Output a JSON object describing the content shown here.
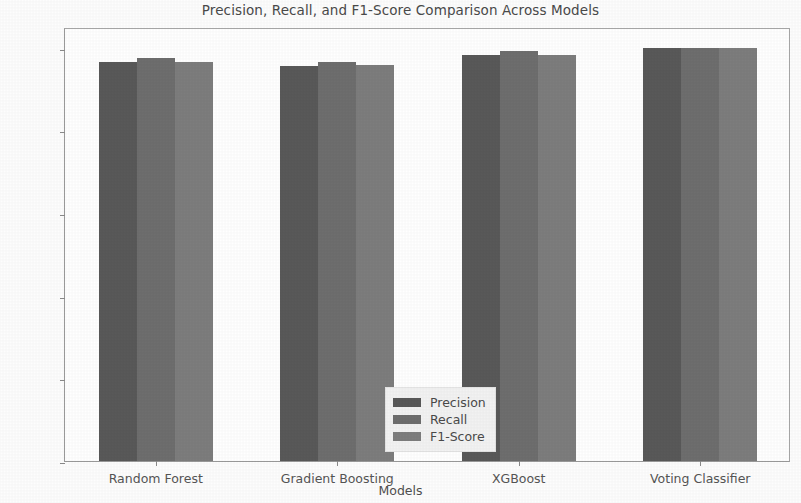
{
  "chart_data": {
    "type": "bar",
    "title": "Precision, Recall, and F1-Score Comparison Across Models",
    "xlabel": "Models",
    "ylabel": "Scores",
    "categories": [
      "Random Forest",
      "Gradient Boosting",
      "XGBoost",
      "Voting Classifier"
    ],
    "series": [
      {
        "name": "Precision",
        "values": [
          0.965,
          0.955,
          0.982,
          1.0
        ],
        "color": "#595959"
      },
      {
        "name": "Recall",
        "values": [
          0.975,
          0.965,
          0.993,
          1.0
        ],
        "color": "#6e6e6e"
      },
      {
        "name": "F1-Score",
        "values": [
          0.965,
          0.957,
          0.982,
          1.0
        ],
        "color": "#7d7d7d"
      }
    ],
    "ylim": [
      0.0,
      1.05
    ],
    "yticks": [
      0.0,
      0.2,
      0.4,
      0.6,
      0.8,
      1.0
    ],
    "ytick_labels": [
      "0.0",
      "0.2",
      "0.4",
      "0.6",
      "0.8",
      "1.0"
    ],
    "grid": false,
    "legend_position": "lower center",
    "legend_entries": [
      "Precision",
      "Recall",
      "F1-Score"
    ],
    "background_color": "#ffffff",
    "axis_color": "#9a9a9a",
    "text_color": "#4a4a4a"
  }
}
